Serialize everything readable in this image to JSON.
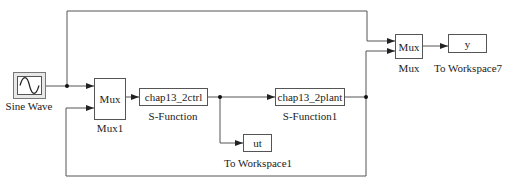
{
  "diagram": {
    "type": "simulink-block-diagram",
    "blocks": {
      "sine_wave": {
        "label": "Sine Wave",
        "icon": "sine-wave-icon"
      },
      "mux1": {
        "text": "Mux",
        "label": "Mux1"
      },
      "ctrl": {
        "text": "chap13_2ctrl",
        "label": "S-Function"
      },
      "plant": {
        "text": "chap13_2plant",
        "label": "S-Function1"
      },
      "ws1": {
        "text": "ut",
        "label": "To Workspace1"
      },
      "mux": {
        "text": "Mux",
        "label": "Mux"
      },
      "ws7": {
        "text": "y",
        "label": "To Workspace7"
      }
    },
    "connections": [
      {
        "from": "Sine Wave",
        "to": "Mux1",
        "port": 1
      },
      {
        "from": "Sine Wave",
        "to": "Mux",
        "port": 1
      },
      {
        "from": "Mux1",
        "to": "S-Function"
      },
      {
        "from": "S-Function",
        "to": "S-Function1"
      },
      {
        "from": "S-Function",
        "to": "To Workspace1"
      },
      {
        "from": "S-Function1",
        "to": "Mux",
        "port": 2
      },
      {
        "from": "S-Function1",
        "to": "Mux1",
        "port": 2
      },
      {
        "from": "Mux",
        "to": "To Workspace7"
      }
    ],
    "colors": {
      "line": "#555555",
      "block_border": "#555555",
      "background": "#ffffff"
    }
  }
}
